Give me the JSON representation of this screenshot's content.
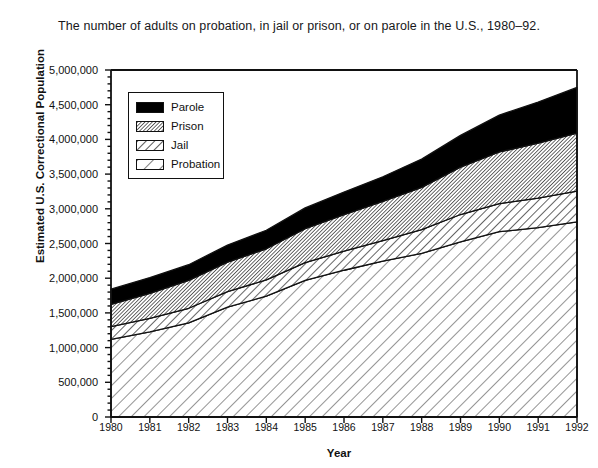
{
  "chart_data": {
    "type": "area",
    "title": "The number of adults on probation, in jail or prison, or on parole in the U.S., 1980–92.",
    "xlabel": "Year",
    "ylabel": "Estimated U.S. Correctional Population",
    "grid": false,
    "legend_position": "upper-left-inside",
    "stacked": true,
    "categories": [
      1980,
      1981,
      1982,
      1983,
      1984,
      1985,
      1986,
      1987,
      1988,
      1989,
      1990,
      1991,
      1992
    ],
    "xtick_labels": [
      "1980",
      "1981",
      "1982",
      "1983",
      "1984",
      "1985",
      "1986",
      "1987",
      "1988",
      "1989",
      "1990",
      "1991",
      "1992"
    ],
    "ytick_labels": [
      "0",
      "500,000",
      "1,000,000",
      "1,500,000",
      "2,000,000",
      "2,500,000",
      "3,000,000",
      "3,500,000",
      "4,000,000",
      "4,500,000",
      "5,000,000"
    ],
    "ytick_values": [
      0,
      500000,
      1000000,
      1500000,
      2000000,
      2500000,
      3000000,
      3500000,
      4000000,
      4500000,
      5000000
    ],
    "ylim": [
      0,
      5000000
    ],
    "yminor_step": 100000,
    "series": [
      {
        "name": "Probation",
        "pattern": "sparse-diagonal-hatch",
        "values": [
          1118097,
          1225934,
          1357264,
          1582947,
          1740948,
          1968712,
          2114621,
          2247158,
          2356483,
          2522125,
          2670234,
          2728472,
          2811611
        ]
      },
      {
        "name": "Jail",
        "pattern": "medium-diagonal-hatch",
        "values": [
          183988,
          196785,
          209582,
          223551,
          234500,
          256615,
          274444,
          295873,
          343569,
          395553,
          405320,
          426479,
          444584
        ]
      },
      {
        "name": "Prison",
        "pattern": "dense-diagonal-hatch",
        "values": [
          319598,
          360029,
          402914,
          423898,
          448264,
          487593,
          526436,
          562814,
          607766,
          683367,
          743382,
          792535,
          833593
        ]
      },
      {
        "name": "Parole",
        "pattern": "solid-black",
        "values": [
          220438,
          225539,
          224604,
          246440,
          266992,
          300203,
          325638,
          355505,
          407977,
          456803,
          531407,
          590442,
          658601
        ]
      }
    ],
    "cumulative": {
      "probation": [
        1118097,
        1225934,
        1357264,
        1582947,
        1740948,
        1968712,
        2114621,
        2247158,
        2356483,
        2522125,
        2670234,
        2728472,
        2811611
      ],
      "jail_top": [
        1302085,
        1422719,
        1566846,
        1806498,
        1975448,
        2225327,
        2389065,
        2543031,
        2700052,
        2917678,
        3075554,
        3154951,
        3256195
      ],
      "prison_top": [
        1621683,
        1782748,
        1969760,
        2230396,
        2423712,
        2712920,
        2915501,
        3105845,
        3307818,
        3601045,
        3818936,
        3947486,
        4089788
      ],
      "parole_top": [
        1842121,
        2008287,
        2194364,
        2476836,
        2690704,
        3013123,
        3241139,
        3461350,
        3715795,
        4057848,
        4350343,
        4537928,
        4748389
      ]
    },
    "legend_entries": [
      {
        "label": "Parole",
        "pattern": "solid-black"
      },
      {
        "label": "Prison",
        "pattern": "dense-diagonal-hatch"
      },
      {
        "label": "Jail",
        "pattern": "medium-diagonal-hatch"
      },
      {
        "label": "Probation",
        "pattern": "sparse-diagonal-hatch"
      }
    ],
    "colors": {
      "axis": "#111111",
      "parole_fill": "#000000",
      "hatch_stroke": "#111111",
      "background": "#ffffff"
    }
  }
}
